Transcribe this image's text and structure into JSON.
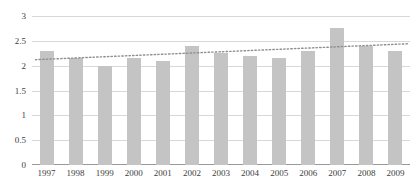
{
  "chart_data": {
    "type": "bar",
    "title": "",
    "subtitle": "",
    "xlabel": "",
    "ylabel": "",
    "categories": [
      "1997",
      "1998",
      "1999",
      "2000",
      "2001",
      "2002",
      "2003",
      "2004",
      "2005",
      "2006",
      "2007",
      "2008",
      "2009"
    ],
    "values": [
      2.3,
      2.15,
      2.0,
      2.15,
      2.1,
      2.4,
      2.25,
      2.2,
      2.15,
      2.3,
      2.75,
      2.4,
      2.3
    ],
    "series": [
      {
        "name": "bars",
        "type": "bar",
        "values": [
          2.3,
          2.15,
          2.0,
          2.15,
          2.1,
          2.4,
          2.25,
          2.2,
          2.15,
          2.3,
          2.75,
          2.4,
          2.3
        ]
      },
      {
        "name": "trendline",
        "type": "line",
        "style": "dotted",
        "values": [
          2.13,
          2.155,
          2.18,
          2.205,
          2.23,
          2.255,
          2.28,
          2.305,
          2.33,
          2.355,
          2.38,
          2.405,
          2.43
        ]
      }
    ],
    "ylim": [
      0,
      3
    ],
    "xlim_categories": 13,
    "yticks": [
      0,
      0.5,
      1,
      1.5,
      2,
      2.5,
      3
    ],
    "ytick_labels": [
      "0",
      "0.5",
      "1",
      "1.5",
      "2",
      "2.5",
      "3"
    ],
    "grid": true,
    "grid_axis": "y",
    "legend": false,
    "legend_position": "none",
    "colors": {
      "bar": "#c4c4c4",
      "trendline": "#8f8f8f",
      "gridline": "#d8d8d8",
      "axis": "#9a9a9a",
      "text": "#3d3d3d",
      "background": "#ffffff"
    }
  }
}
